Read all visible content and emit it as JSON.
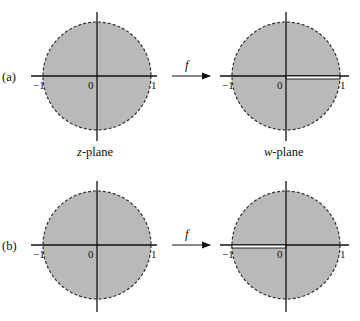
{
  "figure": {
    "colors": {
      "disk_fill": "#b9b9b9",
      "disk_edge": "#333333",
      "axis": "#111111",
      "slit": "#ffffff",
      "background": "#ffffff"
    },
    "rows": [
      {
        "part_label": "(a)",
        "map_label": "f",
        "left_plane": {
          "neg_tick": "−1",
          "origin": "0",
          "pos_tick": "1",
          "caption": "z-plane",
          "caption_var": "z",
          "caption_rest": "-plane"
        },
        "right_plane": {
          "neg_tick": "−1",
          "origin": "0",
          "pos_tick": "1",
          "caption": "w-plane",
          "caption_var": "w",
          "caption_rest": "-plane",
          "slit": "positive real segment [0, 1)"
        }
      },
      {
        "part_label": "(b)",
        "map_label": "f",
        "left_plane": {
          "neg_tick": "−1",
          "origin": "0",
          "pos_tick": "1"
        },
        "right_plane": {
          "neg_tick": "−1",
          "origin": "0",
          "pos_tick": "1",
          "slit": "negative real segment (−1, 0]"
        }
      }
    ]
  }
}
